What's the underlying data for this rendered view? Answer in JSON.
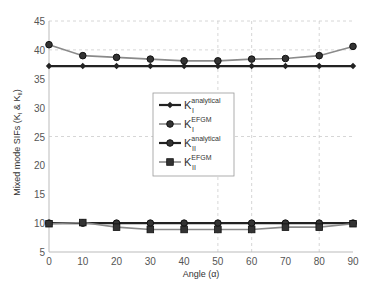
{
  "chart_data": {
    "type": "line",
    "title": "",
    "xlabel": "Angle (α)",
    "ylabel": "Mixed mode SIFs (K_I & K_II)",
    "ylabel_parts": {
      "main": "Mixed mode SIFs (K",
      "sub1": "I",
      "mid": " & K",
      "sub2": "II",
      "end": ")"
    },
    "xlim": [
      0,
      90
    ],
    "ylim": [
      5,
      45
    ],
    "x": [
      0,
      10,
      20,
      30,
      40,
      50,
      60,
      70,
      80,
      90
    ],
    "xticks": [
      0,
      10,
      20,
      30,
      40,
      50,
      60,
      70,
      80,
      90
    ],
    "yticks": [
      5,
      10,
      15,
      20,
      25,
      30,
      35,
      40,
      45
    ],
    "grid": {
      "horizontal_dashed_at": [
        25,
        40,
        45
      ],
      "vertical_dashed_at": [
        50,
        60,
        80
      ]
    },
    "legend_position": "center (inside axes)",
    "series": [
      {
        "name": "K_I^analytical",
        "base": "K",
        "sub": "I",
        "sup": "analytical",
        "color": "#222222",
        "marker": "diamond",
        "width": 2.2,
        "values": [
          37.2,
          37.2,
          37.2,
          37.2,
          37.2,
          37.2,
          37.2,
          37.2,
          37.2,
          37.2
        ]
      },
      {
        "name": "K_I^EFGM",
        "base": "K",
        "sub": "I",
        "sup": "EFGM",
        "color": "#8a8a8a",
        "marker": "circle",
        "width": 1.6,
        "values": [
          40.9,
          39.0,
          38.7,
          38.4,
          38.1,
          38.1,
          38.4,
          38.5,
          39.0,
          40.6
        ]
      },
      {
        "name": "K_II^analytical",
        "base": "K",
        "sub": "II",
        "sup": "analytical",
        "color": "#222222",
        "marker": "circle",
        "width": 2.2,
        "values": [
          10.0,
          10.0,
          10.0,
          10.0,
          10.0,
          10.0,
          10.0,
          10.0,
          10.0,
          10.0
        ]
      },
      {
        "name": "K_II^EFGM",
        "base": "K",
        "sub": "II",
        "sup": "EFGM",
        "color": "#8a8a8a",
        "marker": "square",
        "width": 1.6,
        "values": [
          9.9,
          10.1,
          9.3,
          8.9,
          8.9,
          8.9,
          8.9,
          9.3,
          9.3,
          9.9
        ]
      }
    ]
  },
  "layout": {
    "plot": {
      "left": 49,
      "right": 353,
      "top": 21,
      "bottom": 252
    },
    "legend": {
      "x": 153,
      "y": 93,
      "w": 81,
      "h": 83
    }
  }
}
